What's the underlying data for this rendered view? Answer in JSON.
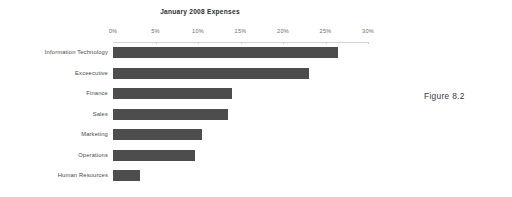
{
  "figure_caption": "Figure 8.2",
  "chart_data": {
    "type": "bar",
    "orientation": "horizontal",
    "title": "January 2008 Expenses",
    "xlabel": "",
    "ylabel": "",
    "categories": [
      "Information Technology",
      "Exceecutive",
      "Finance",
      "Sales",
      "Marketing",
      "Operations",
      "Human Resources"
    ],
    "values": [
      26.5,
      23.0,
      14.0,
      13.5,
      10.5,
      9.6,
      3.2
    ],
    "value_unit": "%",
    "xlim": [
      0,
      30
    ],
    "xticks": [
      0,
      5,
      10,
      15,
      20,
      25,
      30
    ],
    "xtick_labels": [
      "0%",
      "5%",
      "10%",
      "15%",
      "20%",
      "25%",
      "30%"
    ],
    "grid": false,
    "legend": null,
    "bar_color": "#4d4d4d",
    "background_color": "#ffffff",
    "axis_color": "#d2d2d2",
    "title_color": "#2e2e2e",
    "label_color": "#4a4a4a"
  }
}
